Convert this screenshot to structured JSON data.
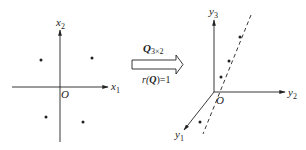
{
  "left_panel": {
    "axis_h_label": "x",
    "axis_h_sub": "1",
    "axis_v_label": "x",
    "axis_v_sub": "2",
    "origin_label": "O",
    "points": [
      {
        "x": 41,
        "y": 60
      },
      {
        "x": 92,
        "y": 58
      },
      {
        "x": 46,
        "y": 117
      },
      {
        "x": 83,
        "y": 122
      }
    ]
  },
  "transform_arrow": {
    "top_label_main": "Q",
    "top_label_sub": "3×2",
    "bottom_label_prefix": "r(",
    "bottom_label_main": "Q",
    "bottom_label_suffix": ")=1"
  },
  "right_panel": {
    "axis_vertical_label": "y",
    "axis_vertical_sub": "3",
    "axis_horizontal_label": "y",
    "axis_horizontal_sub": "2",
    "axis_diagonal_label": "y",
    "axis_diagonal_sub": "1",
    "origin_label": "O",
    "line_style": "dashed",
    "points": [
      {
        "x": 240,
        "y": 37
      },
      {
        "x": 229,
        "y": 61
      },
      {
        "x": 221,
        "y": 77
      },
      {
        "x": 200,
        "y": 122
      }
    ]
  },
  "colors": {
    "stroke": "#222222",
    "background": "#ffffff"
  }
}
